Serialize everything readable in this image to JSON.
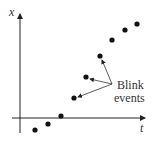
{
  "axes": {
    "y_label": "x",
    "x_label": "t"
  },
  "annotation": {
    "line1": "Blink",
    "line2": "events"
  },
  "points": [
    [
      35,
      130
    ],
    [
      48,
      124
    ],
    [
      61,
      116
    ],
    [
      74,
      98
    ],
    [
      86,
      77
    ],
    [
      100,
      56
    ],
    [
      112,
      40
    ],
    [
      125,
      30
    ],
    [
      137,
      24
    ]
  ],
  "colors": {
    "ink": "#111111"
  }
}
